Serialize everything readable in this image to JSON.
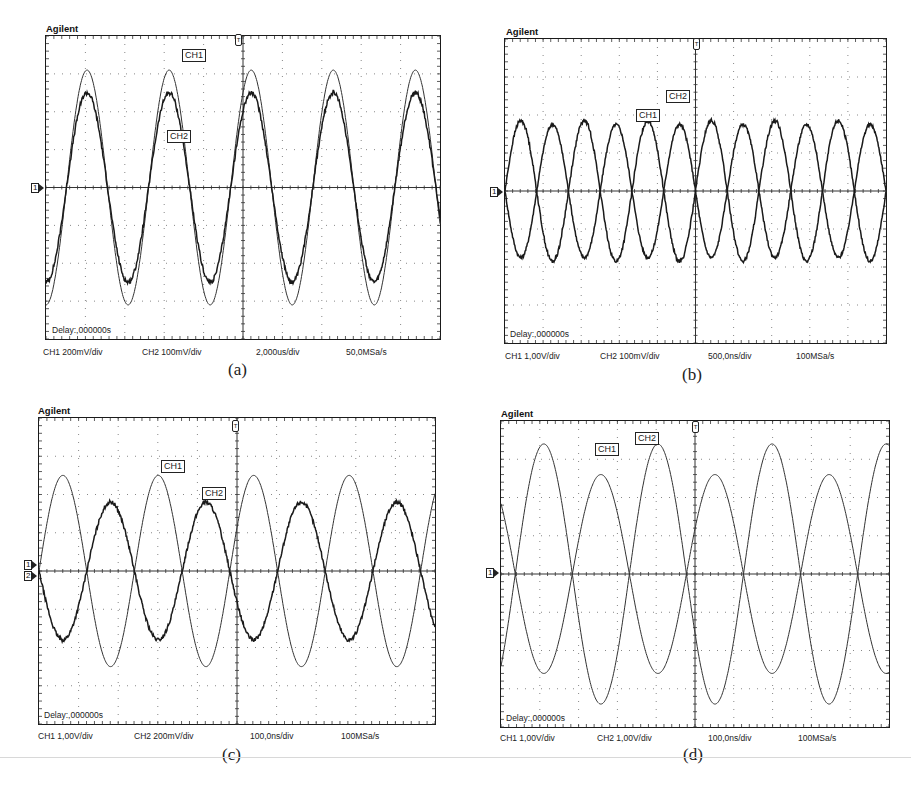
{
  "panels": [
    {
      "id": "a",
      "brand": "Agilent",
      "delay": "Delay:,000000s",
      "caption": "(a)",
      "status": {
        "ch1": "CH1 200mV/div",
        "ch2": "CH2 100mV/div",
        "timebase": "2,000us/div",
        "sample_rate": "50,0MSa/s"
      },
      "ground_markers": [
        "1"
      ],
      "labels": {
        "ch1": "CH1",
        "ch2": "CH2"
      }
    },
    {
      "id": "b",
      "brand": "Agilent",
      "delay": "Delay:,000000s",
      "caption": "(b)",
      "status": {
        "ch1": "CH1 1,00V/div",
        "ch2": "CH2 100mV/div",
        "timebase": "500,0ns/div",
        "sample_rate": "100MSa/s"
      },
      "ground_markers": [
        "1"
      ],
      "labels": {
        "ch1": "CH1",
        "ch2": "CH2"
      }
    },
    {
      "id": "c",
      "brand": "Agilent",
      "delay": "Delay:,000000s",
      "caption": "(c)",
      "status": {
        "ch1": "CH1 1,00V/div",
        "ch2": "CH2 200mV/div",
        "timebase": "100,0ns/div",
        "sample_rate": "100MSa/s"
      },
      "ground_markers": [
        "1",
        "2"
      ],
      "labels": {
        "ch1": "CH1",
        "ch2": "CH2"
      }
    },
    {
      "id": "d",
      "brand": "Agilent",
      "delay": "Delay:,000000s",
      "caption": "(d)",
      "status": {
        "ch1": "CH1 1,00V/div",
        "ch2": "CH2 1,00V/div",
        "timebase": "100,0ns/div",
        "sample_rate": "100MSa/s"
      },
      "ground_markers": [
        "1"
      ],
      "labels": {
        "ch1": "CH1",
        "ch2": "CH2"
      }
    }
  ],
  "chart_data": [
    {
      "type": "line",
      "title": "(a)",
      "xlabel": "time (2,000us/div)",
      "ylabel": "divisions",
      "grid": {
        "x_divisions": 10,
        "y_divisions": 8,
        "style": "dotted"
      },
      "xlim": [
        0,
        10
      ],
      "ylim": [
        -4,
        4
      ],
      "series": [
        {
          "name": "CH1",
          "scale": "200mV/div",
          "amplitude_div": 3.1,
          "periods_on_screen": 4.8,
          "phase_deg": -90,
          "noise": 0
        },
        {
          "name": "CH2",
          "scale": "100mV/div",
          "amplitude_div": 2.5,
          "periods_on_screen": 4.8,
          "phase_deg": -90,
          "noise": 0.06
        }
      ],
      "annotations": [
        "CH1",
        "CH2",
        "Delay:,000000s"
      ]
    },
    {
      "type": "line",
      "title": "(b)",
      "xlabel": "time (500,0ns/div)",
      "ylabel": "divisions",
      "grid": {
        "x_divisions": 10,
        "y_divisions": 8,
        "style": "dotted"
      },
      "xlim": [
        0,
        10
      ],
      "ylim": [
        -4,
        4
      ],
      "series": [
        {
          "name": "CH1",
          "scale": "1,00V/div",
          "amplitude_div": 1.75,
          "periods_on_screen": 6,
          "phase_deg": 180,
          "noise": 0.04,
          "offset_div": 0
        },
        {
          "name": "CH2",
          "scale": "100mV/div",
          "amplitude_div": 1.85,
          "periods_on_screen": 6,
          "phase_deg": 0,
          "noise": 0.05,
          "offset_div": 0
        }
      ],
      "annotations": [
        "CH1",
        "CH2",
        "Delay:,000000s"
      ]
    },
    {
      "type": "line",
      "title": "(c)",
      "xlabel": "time (100,0ns/div)",
      "ylabel": "divisions",
      "grid": {
        "x_divisions": 10,
        "y_divisions": 8,
        "style": "dotted"
      },
      "xlim": [
        0,
        10
      ],
      "ylim": [
        -4,
        4
      ],
      "series": [
        {
          "name": "CH1",
          "scale": "1,00V/div",
          "amplitude_div": 2.5,
          "periods_on_screen": 4.15,
          "phase_deg": 0,
          "noise": 0
        },
        {
          "name": "CH2",
          "scale": "200mV/div",
          "amplitude_div": 1.8,
          "periods_on_screen": 4.15,
          "phase_deg": 180,
          "noise": 0.05
        }
      ],
      "annotations": [
        "CH1",
        "CH2",
        "Delay:,000000s"
      ]
    },
    {
      "type": "line",
      "title": "(d)",
      "xlabel": "time (100,0ns/div)",
      "ylabel": "divisions",
      "grid": {
        "x_divisions": 10,
        "y_divisions": 8,
        "style": "dotted"
      },
      "xlim": [
        0,
        10
      ],
      "ylim": [
        -4,
        4
      ],
      "series": [
        {
          "name": "CH1",
          "scale": "1,00V/div",
          "amplitude_div": 2.6,
          "periods_on_screen": 3.4,
          "phase_deg": 135,
          "noise": 0
        },
        {
          "name": "CH2",
          "scale": "1,00V/div",
          "amplitude_div": 3.4,
          "periods_on_screen": 3.4,
          "phase_deg": -45,
          "noise": 0
        }
      ],
      "annotations": [
        "CH1",
        "CH2",
        "Delay:,000000s"
      ]
    }
  ]
}
